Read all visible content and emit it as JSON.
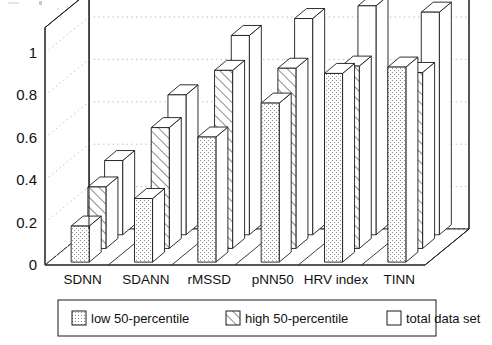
{
  "chart_data": {
    "type": "bar",
    "title": "",
    "subtitle": "",
    "xlabel": "",
    "ylabel": "",
    "categories": [
      "SDNN",
      "SDANN",
      "rMSSD",
      "pNN50",
      "HRV index",
      "TINN"
    ],
    "series": [
      {
        "name": "low 50-percentile",
        "fill": "dotted",
        "values": [
          0.17,
          0.3,
          0.59,
          0.75,
          0.89,
          0.92
        ]
      },
      {
        "name": "high 50-percentile",
        "fill": "diagonal-hatch",
        "values": [
          0.29,
          0.57,
          0.84,
          0.85,
          0.86,
          0.83
        ]
      },
      {
        "name": "total data set",
        "fill": "blank",
        "values": [
          0.35,
          0.66,
          0.94,
          1.02,
          1.08,
          1.05
        ]
      }
    ],
    "ylim": [
      0,
      1.12
    ],
    "yticks": [
      0,
      0.2,
      0.4,
      0.6,
      0.8,
      1
    ],
    "ytick_labels": [
      "0",
      "0.2",
      "0.4",
      "0.6",
      "0.8",
      "1"
    ],
    "grid": true,
    "grid_style": "dotted",
    "projection": "3d",
    "legend_position": "bottom",
    "colors": {
      "line": "#1a1a1a",
      "grid": "#b9b9b9",
      "fill": "#ffffff",
      "text": "#111111"
    }
  },
  "legend": {
    "items": [
      {
        "label": "low 50-percentile",
        "swatch": "dotted-swatch"
      },
      {
        "label": "high 50-percentile",
        "swatch": "hatch-swatch"
      },
      {
        "label": "total data set",
        "swatch": "blank-swatch"
      }
    ]
  },
  "axes": {
    "y_tick_labels": [
      "1",
      "0.8",
      "0.6",
      "0.4",
      "0.2",
      "0"
    ],
    "x_tick_labels": [
      "SDNN",
      "SDANN",
      "rMSSD",
      "pNN50",
      "HRV index",
      "TINN"
    ]
  }
}
